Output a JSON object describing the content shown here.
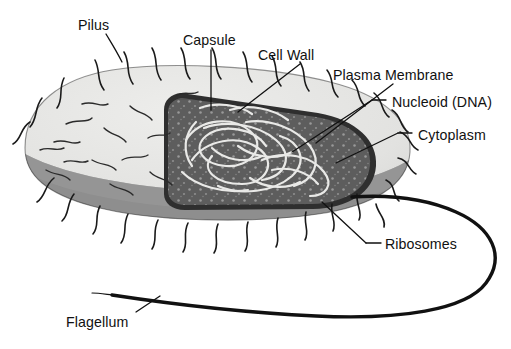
{
  "diagram": {
    "background_color": "#ffffff"
  },
  "palette": {
    "capsule_top": "#e4e4e2",
    "capsule_shadow": "#d3d3d1",
    "cell_wall_band": "#8e8e8e",
    "cell_wall_band_dark": "#7d7d7d",
    "cytoplasm": "#5d5d5d",
    "cytoplasm_rim": "#3a3a3a",
    "nucleoid_strand": "#e8e8e6",
    "ribosome_dot": "#9b9b9b",
    "outline": "#1a1a1a",
    "flagellum": "#111111",
    "pilus": "#1a1a1a",
    "label_text": "#111111",
    "leader_line": "#111111"
  },
  "labels": [
    {
      "id": "pilus",
      "text": "Pilus",
      "x": 78,
      "y": 18,
      "align": "left",
      "icon": "label-leader-line"
    },
    {
      "id": "capsule",
      "text": "Capsule",
      "x": 183,
      "y": 33,
      "align": "left",
      "icon": "label-leader-line"
    },
    {
      "id": "cell-wall",
      "text": "Cell Wall",
      "x": 258,
      "y": 48,
      "align": "left",
      "icon": "label-leader-line"
    },
    {
      "id": "plasma-membrane",
      "text": "Plasma Membrane",
      "x": 333,
      "y": 68,
      "align": "left",
      "icon": "label-leader-line"
    },
    {
      "id": "nucleoid-dna",
      "text": "Nucleoid (DNA)",
      "x": 392,
      "y": 95,
      "align": "left",
      "icon": "label-leader-line"
    },
    {
      "id": "cytoplasm",
      "text": "Cytoplasm",
      "x": 418,
      "y": 128,
      "align": "left",
      "icon": "label-leader-line"
    },
    {
      "id": "ribosomes",
      "text": "Ribosomes",
      "x": 385,
      "y": 237,
      "align": "left",
      "icon": "label-leader-line"
    },
    {
      "id": "flagellum",
      "text": "Flagellum",
      "x": 66,
      "y": 315,
      "align": "left",
      "icon": "label-leader-line"
    }
  ],
  "structures": [
    {
      "id": "capsule",
      "name": "Capsule",
      "description": "Outermost light-gray gel coat enveloping the rod-shaped cell"
    },
    {
      "id": "cell-wall",
      "name": "Cell Wall",
      "description": "Rigid layer beneath the capsule, shown as the mid-gray band"
    },
    {
      "id": "plasma-membrane",
      "name": "Plasma Membrane",
      "description": "Dark rim lining the inner face of the cell wall"
    },
    {
      "id": "cytoplasm",
      "name": "Cytoplasm",
      "description": "Dark gray interior matrix revealed by the cutaway"
    },
    {
      "id": "nucleoid",
      "name": "Nucleoid (DNA)",
      "description": "Tangled pale circular chromosome coiled in the cytoplasm"
    },
    {
      "id": "ribosomes",
      "name": "Ribosomes",
      "description": "Light speckles scattered throughout the cytoplasm"
    },
    {
      "id": "pili",
      "name": "Pilus",
      "description": "Short curved hair-like projections covering the cell surface"
    },
    {
      "id": "flagellum",
      "name": "Flagellum",
      "description": "Single long whip-like tail emerging from the right pole, looping right and trailing left"
    }
  ]
}
